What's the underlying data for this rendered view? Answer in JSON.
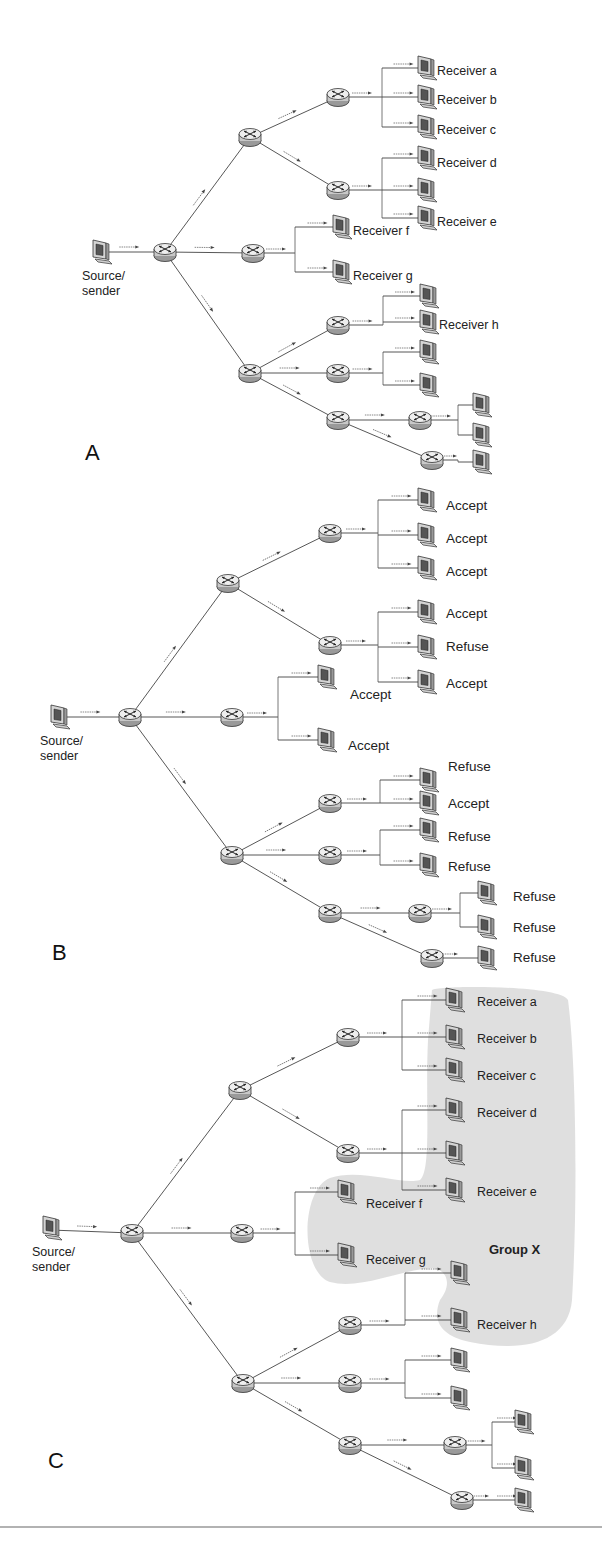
{
  "figure": {
    "panels": [
      {
        "id": "A",
        "letter": "A",
        "letter_pos": [
          85,
          460
        ],
        "source": {
          "label_line1": "Source/",
          "label_line2": "sender",
          "pos": [
            100,
            252
          ]
        },
        "routers": [
          [
            165,
            252
          ],
          [
            250,
            137
          ],
          [
            253,
            253
          ],
          [
            250,
            373
          ],
          [
            338,
            97
          ],
          [
            338,
            190
          ],
          [
            338,
            325
          ],
          [
            338,
            373
          ],
          [
            338,
            420
          ],
          [
            420,
            420
          ],
          [
            432,
            460
          ]
        ],
        "links": [
          [
            [
              100,
              252
            ],
            [
              165,
              252
            ]
          ],
          [
            [
              165,
              252
            ],
            [
              250,
              137
            ]
          ],
          [
            [
              165,
              252
            ],
            [
              253,
              253
            ]
          ],
          [
            [
              165,
              252
            ],
            [
              250,
              373
            ]
          ],
          [
            [
              250,
              137
            ],
            [
              338,
              97
            ]
          ],
          [
            [
              250,
              137
            ],
            [
              338,
              190
            ]
          ],
          [
            [
              250,
              373
            ],
            [
              338,
              325
            ]
          ],
          [
            [
              250,
              373
            ],
            [
              338,
              373
            ]
          ],
          [
            [
              250,
              373
            ],
            [
              338,
              420
            ]
          ],
          [
            [
              338,
              420
            ],
            [
              420,
              420
            ]
          ],
          [
            [
              338,
              420
            ],
            [
              432,
              460
            ]
          ]
        ],
        "branches": [
          {
            "trunk_x": 382,
            "from": [
              338,
              97
            ],
            "targets": [
              [
                425,
                68
              ],
              [
                425,
                97
              ],
              [
                425,
                127
              ]
            ]
          },
          {
            "trunk_x": 382,
            "from": [
              338,
              190
            ],
            "targets": [
              [
                425,
                158
              ],
              [
                425,
                190
              ],
              [
                425,
                218
              ]
            ]
          },
          {
            "trunk_x": 295,
            "from": [
              253,
              253
            ],
            "targets": [
              [
                340,
                227
              ],
              [
                340,
                272
              ]
            ]
          },
          {
            "trunk_x": 383,
            "from": [
              338,
              325
            ],
            "targets": [
              [
                427,
                296
              ],
              [
                427,
                322
              ]
            ]
          },
          {
            "trunk_x": 383,
            "from": [
              338,
              373
            ],
            "targets": [
              [
                427,
                352
              ],
              [
                427,
                385
              ]
            ]
          },
          {
            "trunk_x": 458,
            "from": [
              420,
              420
            ],
            "targets": [
              [
                480,
                405
              ],
              [
                480,
                435
              ]
            ]
          },
          {
            "trunk_x": 458,
            "from": [
              432,
              460
            ],
            "targets": [
              [
                480,
                462
              ]
            ]
          }
        ],
        "labels": [
          {
            "text": "Receiver a",
            "pos": [
              437,
              75
            ]
          },
          {
            "text": "Receiver b",
            "pos": [
              437,
              104
            ]
          },
          {
            "text": "Receiver c",
            "pos": [
              437,
              134
            ]
          },
          {
            "text": "Receiver d",
            "pos": [
              437,
              167
            ]
          },
          {
            "text": "Receiver e",
            "pos": [
              437,
              226
            ]
          },
          {
            "text": "Receiver f",
            "pos": [
              353,
              235
            ]
          },
          {
            "text": "Receiver g",
            "pos": [
              353,
              280
            ]
          },
          {
            "text": "Receiver h",
            "pos": [
              439,
              329
            ]
          }
        ]
      },
      {
        "id": "B",
        "letter": "B",
        "letter_pos": [
          52,
          960
        ],
        "source": {
          "label_line1": "Source/",
          "label_line2": "sender",
          "pos": [
            58,
            717
          ]
        },
        "routers": [
          [
            130,
            717
          ],
          [
            228,
            583
          ],
          [
            232,
            717
          ],
          [
            232,
            855
          ],
          [
            330,
            533
          ],
          [
            330,
            645
          ],
          [
            330,
            803
          ],
          [
            330,
            855
          ],
          [
            330,
            913
          ],
          [
            420,
            913
          ],
          [
            432,
            958
          ]
        ],
        "links": [
          [
            [
              58,
              717
            ],
            [
              130,
              717
            ]
          ],
          [
            [
              130,
              717
            ],
            [
              228,
              583
            ]
          ],
          [
            [
              130,
              717
            ],
            [
              232,
              717
            ]
          ],
          [
            [
              130,
              717
            ],
            [
              232,
              855
            ]
          ],
          [
            [
              228,
              583
            ],
            [
              330,
              533
            ]
          ],
          [
            [
              228,
              583
            ],
            [
              330,
              645
            ]
          ],
          [
            [
              232,
              855
            ],
            [
              330,
              803
            ]
          ],
          [
            [
              232,
              855
            ],
            [
              330,
              855
            ]
          ],
          [
            [
              232,
              855
            ],
            [
              330,
              913
            ]
          ],
          [
            [
              330,
              913
            ],
            [
              420,
              913
            ]
          ],
          [
            [
              330,
              913
            ],
            [
              432,
              958
            ]
          ]
        ],
        "branches": [
          {
            "trunk_x": 378,
            "from": [
              330,
              533
            ],
            "targets": [
              [
                425,
                500
              ],
              [
                425,
                535
              ],
              [
                425,
                568
              ]
            ]
          },
          {
            "trunk_x": 378,
            "from": [
              330,
              645
            ],
            "targets": [
              [
                425,
                612
              ],
              [
                425,
                647
              ],
              [
                425,
                682
              ]
            ]
          },
          {
            "trunk_x": 278,
            "from": [
              232,
              717
            ],
            "targets": [
              [
                325,
                677
              ],
              [
                325,
                740
              ]
            ]
          },
          {
            "trunk_x": 380,
            "from": [
              330,
              803
            ],
            "targets": [
              [
                427,
                780
              ],
              [
                427,
                803
              ]
            ]
          },
          {
            "trunk_x": 380,
            "from": [
              330,
              855
            ],
            "targets": [
              [
                427,
                830
              ],
              [
                427,
                865
              ]
            ]
          },
          {
            "trunk_x": 460,
            "from": [
              420,
              913
            ],
            "targets": [
              [
                485,
                893
              ],
              [
                485,
                927
              ]
            ]
          },
          {
            "trunk_x": 460,
            "from": [
              432,
              958
            ],
            "targets": [
              [
                485,
                958
              ]
            ]
          }
        ],
        "labels": [
          {
            "text": "Accept",
            "pos": [
              446,
              510
            ]
          },
          {
            "text": "Accept",
            "pos": [
              446,
              543
            ]
          },
          {
            "text": "Accept",
            "pos": [
              446,
              576
            ]
          },
          {
            "text": "Accept",
            "pos": [
              446,
              618
            ]
          },
          {
            "text": "Refuse",
            "pos": [
              446,
              651
            ]
          },
          {
            "text": "Accept",
            "pos": [
              446,
              688
            ]
          },
          {
            "text": "Accept",
            "pos": [
              350,
              699
            ]
          },
          {
            "text": "Accept",
            "pos": [
              348,
              750
            ]
          },
          {
            "text": "Refuse",
            "pos": [
              448,
              771
            ]
          },
          {
            "text": "Accept",
            "pos": [
              448,
              808
            ]
          },
          {
            "text": "Refuse",
            "pos": [
              448,
              841
            ]
          },
          {
            "text": "Refuse",
            "pos": [
              448,
              871
            ]
          },
          {
            "text": "Refuse",
            "pos": [
              513,
              901
            ]
          },
          {
            "text": "Refuse",
            "pos": [
              513,
              932
            ]
          },
          {
            "text": "Refuse",
            "pos": [
              513,
              962
            ]
          }
        ]
      },
      {
        "id": "C",
        "letter": "C",
        "letter_pos": [
          48,
          1468
        ],
        "source": {
          "label_line1": "Source/",
          "label_line2": "sender",
          "pos": [
            50,
            1228
          ]
        },
        "routers": [
          [
            132,
            1233
          ],
          [
            240,
            1090
          ],
          [
            242,
            1233
          ],
          [
            243,
            1383
          ],
          [
            348,
            1037
          ],
          [
            348,
            1153
          ],
          [
            350,
            1325
          ],
          [
            350,
            1383
          ],
          [
            350,
            1445
          ],
          [
            455,
            1445
          ],
          [
            462,
            1500
          ]
        ],
        "links": [
          [
            [
              50,
              1230
            ],
            [
              132,
              1233
            ]
          ],
          [
            [
              132,
              1233
            ],
            [
              240,
              1090
            ]
          ],
          [
            [
              132,
              1233
            ],
            [
              242,
              1233
            ]
          ],
          [
            [
              132,
              1233
            ],
            [
              243,
              1383
            ]
          ],
          [
            [
              240,
              1090
            ],
            [
              348,
              1037
            ]
          ],
          [
            [
              240,
              1090
            ],
            [
              348,
              1153
            ]
          ],
          [
            [
              243,
              1383
            ],
            [
              350,
              1325
            ]
          ],
          [
            [
              243,
              1383
            ],
            [
              350,
              1383
            ]
          ],
          [
            [
              243,
              1383
            ],
            [
              350,
              1445
            ]
          ],
          [
            [
              350,
              1445
            ],
            [
              455,
              1445
            ]
          ],
          [
            [
              350,
              1445
            ],
            [
              462,
              1500
            ]
          ]
        ],
        "branches": [
          {
            "trunk_x": 402,
            "from": [
              348,
              1037
            ],
            "targets": [
              [
                453,
                1000
              ],
              [
                453,
                1037
              ],
              [
                453,
                1070
              ]
            ]
          },
          {
            "trunk_x": 402,
            "from": [
              348,
              1153
            ],
            "targets": [
              [
                453,
                1110
              ],
              [
                453,
                1153
              ],
              [
                453,
                1190
              ]
            ]
          },
          {
            "trunk_x": 295,
            "from": [
              242,
              1233
            ],
            "targets": [
              [
                345,
                1192
              ],
              [
                345,
                1255
              ]
            ]
          },
          {
            "trunk_x": 405,
            "from": [
              350,
              1325
            ],
            "targets": [
              [
                458,
                1273
              ],
              [
                458,
                1320
              ]
            ]
          },
          {
            "trunk_x": 405,
            "from": [
              350,
              1383
            ],
            "targets": [
              [
                458,
                1360
              ],
              [
                458,
                1398
              ]
            ]
          },
          {
            "trunk_x": 492,
            "from": [
              455,
              1445
            ],
            "targets": [
              [
                522,
                1422
              ],
              [
                522,
                1468
              ]
            ]
          },
          {
            "trunk_x": 492,
            "from": [
              462,
              1500
            ],
            "targets": [
              [
                522,
                1500
              ]
            ]
          }
        ],
        "labels": [
          {
            "text": "Receiver a",
            "pos": [
              477,
              1006
            ]
          },
          {
            "text": "Receiver b",
            "pos": [
              477,
              1043
            ]
          },
          {
            "text": "Receiver c",
            "pos": [
              477,
              1080
            ]
          },
          {
            "text": "Receiver d",
            "pos": [
              477,
              1117
            ]
          },
          {
            "text": "Receiver e",
            "pos": [
              477,
              1196
            ]
          },
          {
            "text": "Receiver f",
            "pos": [
              366,
              1208
            ]
          },
          {
            "text": "Receiver g",
            "pos": [
              366,
              1264
            ]
          },
          {
            "text": "Receiver h",
            "pos": [
              477,
              1329
            ]
          }
        ],
        "group": {
          "label": "Group X",
          "label_pos": [
            489,
            1254
          ],
          "fill": "#d9d9d9"
        }
      }
    ],
    "bottom_rule_y": 1527,
    "colors": {
      "line": "#444444",
      "icon": "#333333",
      "group_shade": "#d9d9d9"
    }
  }
}
